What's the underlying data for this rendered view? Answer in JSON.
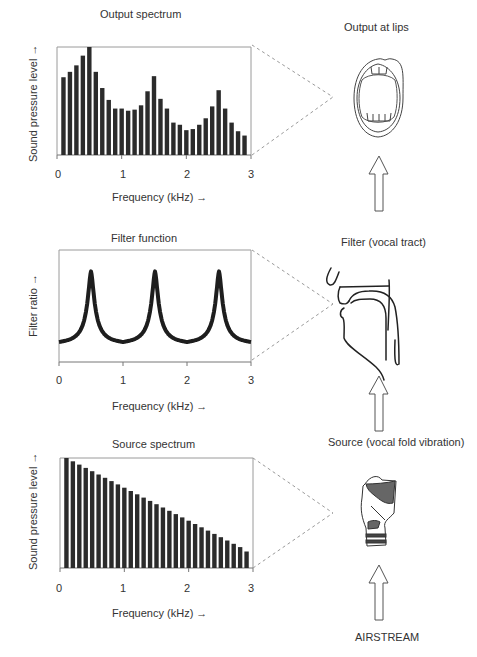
{
  "panels": {
    "output": {
      "title": "Output spectrum",
      "ylabel": "Sound pressure level →",
      "xlabel": "Frequency (kHz) →",
      "ticks": [
        "0",
        "1",
        "2",
        "3"
      ],
      "right_label": "Output at lips"
    },
    "filter": {
      "title": "Filter function",
      "ylabel": "Filter ratio →",
      "xlabel": "Frequency (kHz) →",
      "ticks": [
        "0",
        "1",
        "2",
        "3"
      ],
      "right_label": "Filter (vocal tract)"
    },
    "source": {
      "title": "Source spectrum",
      "ylabel": "Sound pressure level →",
      "xlabel": "Frequency (kHz) →",
      "ticks": [
        "0",
        "1",
        "2",
        "3"
      ],
      "right_label": "Source (vocal fold vibration)"
    }
  },
  "bottom_label": "AIRSTREAM",
  "icons": {
    "mouth": "open-mouth-lips-illustration",
    "vocal_tract": "vocal-tract-sagittal-illustration",
    "larynx": "larynx-illustration",
    "arrow": "up-arrow-outline"
  },
  "colors": {
    "bar": "#2b2b2b",
    "frame": "#9a9a9a",
    "dashed": "#9a9a9a",
    "curve": "#1e1e1e",
    "larynx_fill": "#666666"
  },
  "chart_data": [
    {
      "type": "bar",
      "title": "Output spectrum",
      "xlabel": "Frequency (kHz) →",
      "ylabel": "Sound pressure level →",
      "xlim": [
        0,
        3
      ],
      "ylim": [
        0,
        100
      ],
      "xticks": [
        0,
        1,
        2,
        3
      ],
      "grid": false,
      "x": [
        0.1,
        0.2,
        0.3,
        0.4,
        0.5,
        0.6,
        0.7,
        0.8,
        0.9,
        1.0,
        1.1,
        1.2,
        1.3,
        1.4,
        1.5,
        1.6,
        1.7,
        1.8,
        1.9,
        2.0,
        2.1,
        2.2,
        2.3,
        2.4,
        2.5,
        2.6,
        2.7,
        2.8,
        2.9
      ],
      "values": [
        72,
        77,
        83,
        92,
        100,
        77,
        62,
        51,
        43,
        43,
        41,
        42,
        46,
        59,
        73,
        52,
        43,
        30,
        28,
        23,
        24,
        28,
        34,
        45,
        60,
        43,
        30,
        22,
        18
      ]
    },
    {
      "type": "line",
      "title": "Filter function",
      "xlabel": "Frequency (kHz) →",
      "ylabel": "Filter ratio →",
      "xlim": [
        0,
        3
      ],
      "xticks": [
        0,
        1,
        2,
        3
      ],
      "grid": false,
      "peaks_khz": [
        0.5,
        1.5,
        2.5
      ],
      "troughs_khz": [
        0,
        1,
        2,
        3
      ],
      "x": [
        0,
        0.1,
        0.2,
        0.3,
        0.4,
        0.45,
        0.5,
        0.55,
        0.6,
        0.7,
        0.8,
        0.9,
        1.0,
        1.1,
        1.2,
        1.3,
        1.4,
        1.45,
        1.5,
        1.55,
        1.6,
        1.7,
        1.8,
        1.9,
        2.0,
        2.1,
        2.2,
        2.3,
        2.4,
        2.45,
        2.5,
        2.55,
        2.6,
        2.7,
        2.8,
        2.9,
        3.0
      ],
      "values": [
        20,
        26,
        36,
        52,
        76,
        92,
        96,
        92,
        76,
        52,
        36,
        26,
        20,
        26,
        36,
        52,
        76,
        92,
        96,
        92,
        76,
        52,
        36,
        26,
        20,
        26,
        36,
        52,
        76,
        92,
        96,
        92,
        76,
        52,
        36,
        26,
        20
      ]
    },
    {
      "type": "bar",
      "title": "Source spectrum",
      "xlabel": "Frequency (kHz) →",
      "ylabel": "Sound pressure level →",
      "xlim": [
        0,
        3
      ],
      "ylim": [
        0,
        100
      ],
      "xticks": [
        0,
        1,
        2,
        3
      ],
      "grid": false,
      "x": [
        0.1,
        0.2,
        0.3,
        0.4,
        0.5,
        0.6,
        0.7,
        0.8,
        0.9,
        1.0,
        1.1,
        1.2,
        1.3,
        1.4,
        1.5,
        1.6,
        1.7,
        1.8,
        1.9,
        2.0,
        2.1,
        2.2,
        2.3,
        2.4,
        2.5,
        2.6,
        2.7,
        2.8,
        2.9
      ],
      "values": [
        100,
        97,
        94,
        91,
        88,
        85,
        82,
        79,
        76,
        73,
        70,
        67,
        64,
        61,
        58,
        55,
        52,
        49,
        46,
        43,
        40,
        37,
        34,
        31,
        28,
        25,
        22,
        19,
        15
      ]
    }
  ]
}
